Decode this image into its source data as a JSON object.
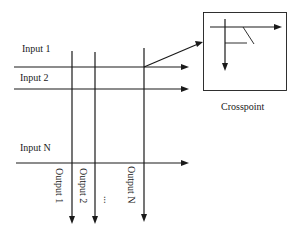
{
  "diagram": {
    "type": "crossbar-switch",
    "inputs": [
      {
        "label": "Input 1"
      },
      {
        "label": "Input 2"
      },
      {
        "label": "Input N"
      }
    ],
    "outputs": [
      {
        "label": "Output 1"
      },
      {
        "label": "Output 2"
      },
      {
        "label": "Output N"
      }
    ],
    "ellipsis": "...",
    "inset": {
      "label": "Crosspoint"
    },
    "colors": {
      "line": "#1a1a1a",
      "background": "#ffffff"
    }
  }
}
